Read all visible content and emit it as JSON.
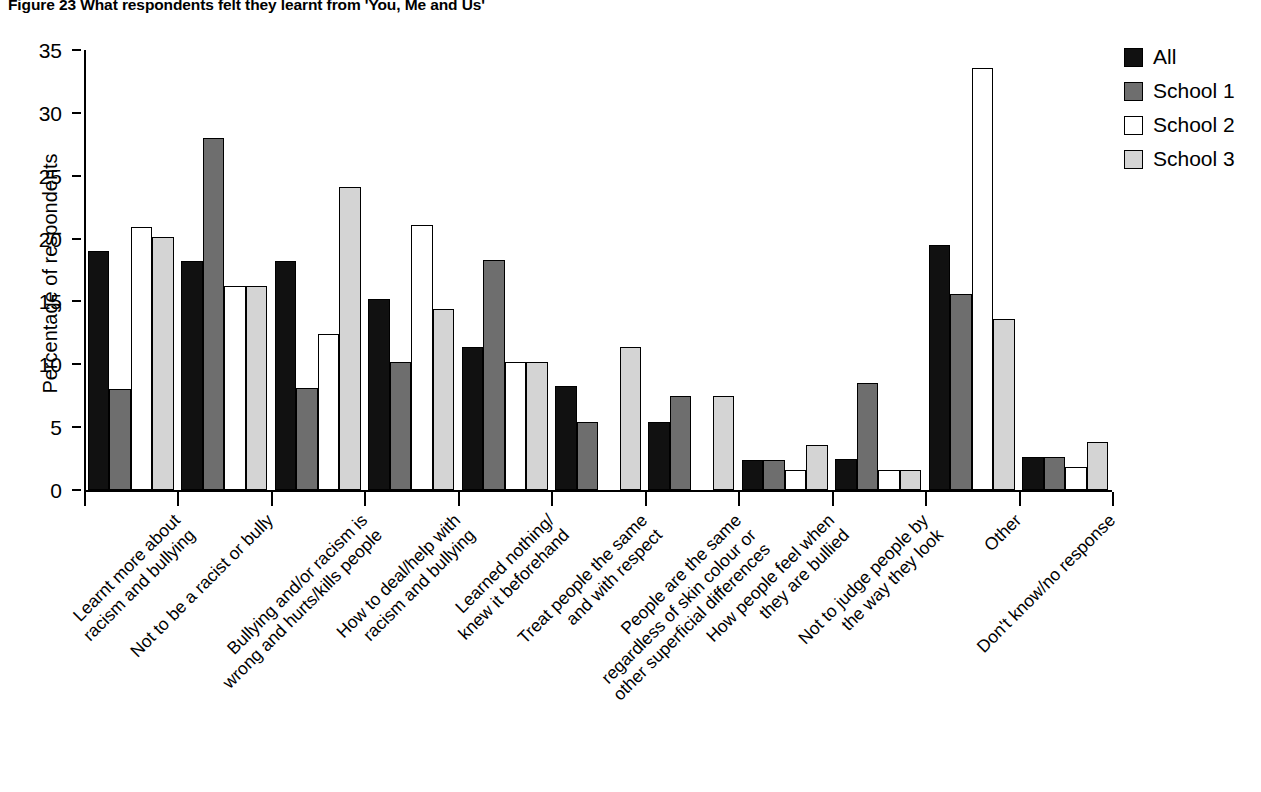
{
  "figure": {
    "title": "Figure 23  What respondents felt they learnt from 'You, Me and Us'"
  },
  "legend": {
    "position": "top-right",
    "entries": [
      {
        "label": "All",
        "swatch": "black",
        "color": "#111111"
      },
      {
        "label": "School 1",
        "swatch": "dark-gray",
        "color": "#6e6e6e"
      },
      {
        "label": "School 2",
        "swatch": "white",
        "color": "#ffffff"
      },
      {
        "label": "School 3",
        "swatch": "light-gray",
        "color": "#d4d4d4"
      }
    ]
  },
  "axes": {
    "y_title": "Percentage of respondents",
    "y_ticks": [
      "0",
      "5",
      "10",
      "15",
      "20",
      "25",
      "30",
      "35"
    ],
    "x_title": ""
  },
  "chart_data": {
    "type": "bar",
    "title": "Figure 23  What respondents felt they learnt from 'You, Me and Us'",
    "xlabel": "",
    "ylabel": "Percentage of respondents",
    "ylim": [
      0,
      35
    ],
    "ytick_step": 5,
    "grid": false,
    "legend_position": "top-right",
    "categories": [
      "Learnt more about\nracism and bullying",
      "Not to be a racist or bully",
      "Bullying and/or racism is\nwrong and hurts/kills people",
      "How to deal/help with\nracism and bullying",
      "Learned nothing/\nknew it beforehand",
      "Treat people the same\nand with respect",
      "People are the same\nregardless of skin colour or\nother superficial differences",
      "How people feel when\nthey are bullied",
      "Not to judge people by\nthe way they look",
      "Other",
      "Don't know/no response"
    ],
    "series": [
      {
        "name": "All",
        "color": "#111111",
        "values": [
          19.0,
          18.2,
          18.2,
          15.2,
          11.4,
          8.3,
          5.4,
          2.4,
          2.5,
          19.5,
          2.6
        ]
      },
      {
        "name": "School 1",
        "color": "#6e6e6e",
        "values": [
          8.0,
          28.0,
          8.1,
          10.2,
          18.3,
          5.4,
          7.5,
          2.4,
          8.5,
          15.6,
          2.6
        ]
      },
      {
        "name": "School 2",
        "color": "#ffffff",
        "values": [
          20.9,
          16.2,
          12.4,
          21.1,
          10.2,
          0.0,
          0.0,
          1.6,
          1.6,
          33.6,
          1.8
        ]
      },
      {
        "name": "School 3",
        "color": "#d4d4d4",
        "values": [
          20.1,
          16.2,
          24.1,
          14.4,
          10.2,
          11.4,
          7.5,
          3.6,
          1.6,
          13.6,
          3.8
        ]
      }
    ]
  }
}
